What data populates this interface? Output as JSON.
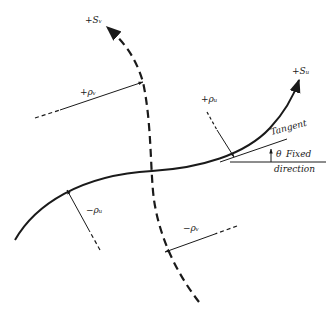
{
  "diagram": {
    "colors": {
      "ink": "#1a1a1a",
      "background": "#ffffff"
    },
    "labels": {
      "s_v": "+Sᵥ",
      "s_u": "+Sᵤ",
      "rho_v_pos": "+ρᵥ",
      "rho_u_pos": "+ρᵤ",
      "rho_u_neg": "−ρᵤ",
      "rho_v_neg": "−ρᵥ",
      "tangent": "Tangent",
      "theta": "θ",
      "fixed": "Fixed",
      "direction": "direction"
    },
    "elements": [
      "solid curve +S_u (u-line) with arrow",
      "dashed curve +S_v (v-line) with arrow",
      "radius arrow +rho_v",
      "radius arrow +rho_u",
      "radius arrow -rho_u",
      "radius arrow -rho_v",
      "tangent line",
      "fixed direction line",
      "angle theta arc arrow"
    ]
  }
}
